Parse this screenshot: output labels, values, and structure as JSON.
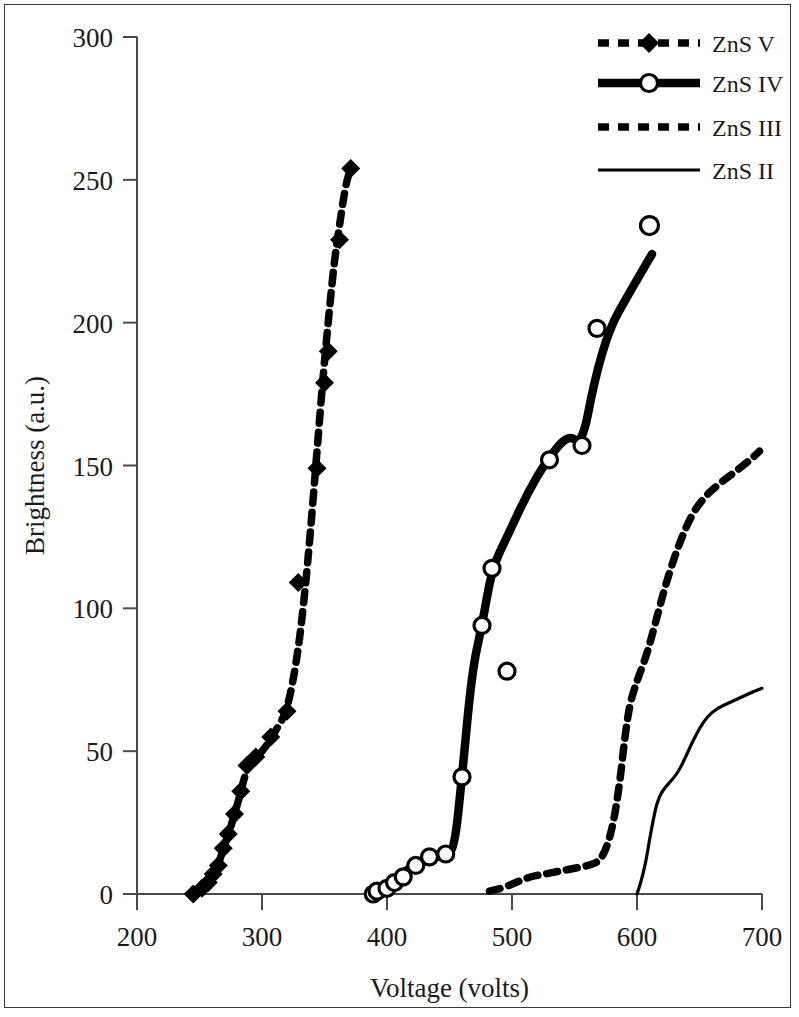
{
  "chart_data": {
    "type": "line",
    "title": "",
    "xlabel": "Voltage (volts)",
    "ylabel": "Brightness (a.u.)",
    "xlim": [
      200,
      700
    ],
    "ylim": [
      0,
      300
    ],
    "xticks": [
      200,
      300,
      400,
      500,
      600,
      700
    ],
    "yticks": [
      0,
      50,
      100,
      150,
      200,
      250,
      300
    ],
    "grid": false,
    "legend_position": "top-right",
    "series": [
      {
        "name": "ZnS V",
        "style": "dashed",
        "marker": "filled-diamond",
        "line_points": [
          [
            245,
            0
          ],
          [
            249,
            1
          ],
          [
            253,
            2
          ],
          [
            257,
            4
          ],
          [
            261,
            6
          ],
          [
            264,
            9
          ],
          [
            267,
            13
          ],
          [
            270,
            17
          ],
          [
            274,
            22
          ],
          [
            278,
            28
          ],
          [
            282,
            34
          ],
          [
            286,
            41
          ],
          [
            290,
            46
          ],
          [
            296,
            48
          ],
          [
            304,
            52
          ],
          [
            312,
            58
          ],
          [
            320,
            64
          ],
          [
            328,
            82
          ],
          [
            334,
            104
          ],
          [
            339,
            128
          ],
          [
            344,
            155
          ],
          [
            349,
            182
          ],
          [
            354,
            205
          ],
          [
            358,
            222
          ],
          [
            362,
            234
          ],
          [
            365,
            243
          ],
          [
            368,
            250
          ],
          [
            371,
            254
          ]
        ],
        "markers": [
          [
            245,
            0
          ],
          [
            252,
            2
          ],
          [
            257,
            4
          ],
          [
            261,
            7
          ],
          [
            265,
            10
          ],
          [
            269,
            16
          ],
          [
            273,
            21
          ],
          [
            278,
            28
          ],
          [
            283,
            36
          ],
          [
            288,
            45
          ],
          [
            295,
            48
          ],
          [
            307,
            55
          ],
          [
            320,
            64
          ],
          [
            344,
            149
          ],
          [
            350,
            179
          ],
          [
            353,
            190
          ],
          [
            362,
            229
          ],
          [
            371,
            254
          ],
          [
            329,
            109
          ]
        ]
      },
      {
        "name": "ZnS IV",
        "style": "solid-thick",
        "marker": "open-circle",
        "line_points": [
          [
            388,
            0
          ],
          [
            392,
            1
          ],
          [
            396,
            2
          ],
          [
            401,
            3
          ],
          [
            406,
            5
          ],
          [
            412,
            7
          ],
          [
            418,
            9
          ],
          [
            425,
            11
          ],
          [
            432,
            12
          ],
          [
            440,
            13
          ],
          [
            448,
            14
          ],
          [
            454,
            16
          ],
          [
            460,
            41
          ],
          [
            468,
            78
          ],
          [
            476,
            94
          ],
          [
            484,
            114
          ],
          [
            496,
            125
          ],
          [
            512,
            140
          ],
          [
            528,
            152
          ],
          [
            545,
            161
          ],
          [
            556,
            157
          ],
          [
            566,
            180
          ],
          [
            578,
            198
          ],
          [
            592,
            209
          ],
          [
            604,
            218
          ],
          [
            612,
            224
          ]
        ],
        "markers": [
          [
            389,
            0
          ],
          [
            392,
            1
          ],
          [
            400,
            2
          ],
          [
            406,
            4
          ],
          [
            413,
            6
          ],
          [
            423,
            10
          ],
          [
            434,
            13
          ],
          [
            447,
            14
          ],
          [
            460,
            41
          ],
          [
            476,
            94
          ],
          [
            484,
            114
          ],
          [
            496,
            78
          ],
          [
            530,
            152
          ],
          [
            556,
            157
          ],
          [
            568,
            198
          ]
        ],
        "extra_markers": [
          [
            610,
            234
          ]
        ]
      },
      {
        "name": "ZnS III",
        "style": "dashed",
        "marker": "none",
        "line_points": [
          [
            482,
            1
          ],
          [
            492,
            2
          ],
          [
            503,
            4
          ],
          [
            514,
            6
          ],
          [
            526,
            7
          ],
          [
            538,
            8
          ],
          [
            550,
            9
          ],
          [
            562,
            10
          ],
          [
            572,
            12
          ],
          [
            580,
            22
          ],
          [
            586,
            38
          ],
          [
            590,
            54
          ],
          [
            594,
            66
          ],
          [
            598,
            72
          ],
          [
            602,
            77
          ],
          [
            608,
            84
          ],
          [
            616,
            97
          ],
          [
            624,
            110
          ],
          [
            634,
            123
          ],
          [
            644,
            133
          ],
          [
            654,
            139
          ],
          [
            664,
            143
          ],
          [
            676,
            147
          ],
          [
            688,
            151
          ],
          [
            698,
            155
          ]
        ],
        "markers": []
      },
      {
        "name": "ZnS II",
        "style": "solid-thin",
        "marker": "none",
        "line_points": [
          [
            600,
            0
          ],
          [
            603,
            4
          ],
          [
            607,
            11
          ],
          [
            610,
            19
          ],
          [
            613,
            26
          ],
          [
            616,
            32
          ],
          [
            620,
            36
          ],
          [
            626,
            39
          ],
          [
            632,
            42
          ],
          [
            638,
            47
          ],
          [
            644,
            53
          ],
          [
            650,
            58
          ],
          [
            656,
            62
          ],
          [
            664,
            65
          ],
          [
            674,
            67
          ],
          [
            684,
            69
          ],
          [
            694,
            71
          ],
          [
            700,
            72
          ]
        ],
        "markers": []
      }
    ]
  },
  "legend": {
    "entries": [
      {
        "label": "ZnS V",
        "style": "dashed",
        "marker": "filled-diamond"
      },
      {
        "label": "ZnS IV",
        "style": "solid-thick",
        "marker": "open-circle"
      },
      {
        "label": "ZnS III",
        "style": "dashed",
        "marker": "none"
      },
      {
        "label": "ZnS II",
        "style": "solid-thin",
        "marker": "none"
      }
    ]
  },
  "colors": {
    "ink": "#000000",
    "axis": "#4a4a4a",
    "frame": "#3a3a3a",
    "background": "#ffffff"
  }
}
